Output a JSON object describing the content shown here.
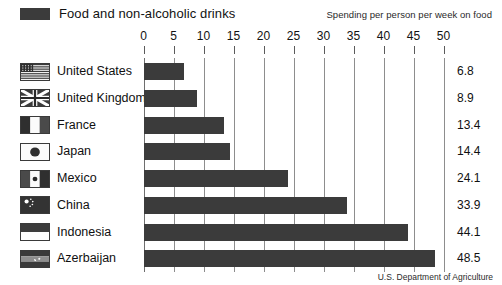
{
  "legend": {
    "swatch_color": "#3b3b3b",
    "label": "Food and non-alcoholic drinks"
  },
  "subtitle": "Spending per person per week on food",
  "source": "U.S. Department of Agriculture",
  "chart_data": {
    "type": "bar",
    "orientation": "horizontal",
    "title": "Spending per person per week on food",
    "series_name": "Food and non-alcoholic drinks",
    "categories": [
      "United States",
      "United Kingdom",
      "France",
      "Japan",
      "Mexico",
      "China",
      "Indonesia",
      "Azerbaijan"
    ],
    "values": [
      6.8,
      8.9,
      13.4,
      14.4,
      24.1,
      33.9,
      44.1,
      48.5
    ],
    "value_labels": [
      "6.8",
      "8.9",
      "13.4",
      "14.4",
      "24.1",
      "33.9",
      "44.1",
      "48.5"
    ],
    "flags": [
      "flag-united-states",
      "flag-united-kingdom",
      "flag-france",
      "flag-japan",
      "flag-mexico",
      "flag-china",
      "flag-indonesia",
      "flag-azerbaijan"
    ],
    "xlabel": "",
    "ylabel": "",
    "xlim": [
      0,
      50
    ],
    "xticks": [
      0,
      5,
      10,
      15,
      20,
      25,
      30,
      35,
      40,
      45,
      50
    ],
    "xtick_labels": [
      "0",
      "5",
      "10",
      "15",
      "20",
      "25",
      "30",
      "35",
      "40",
      "45",
      "50"
    ],
    "grid": true,
    "legend_position": "top-left",
    "bar_color": "#3b3b3b"
  }
}
